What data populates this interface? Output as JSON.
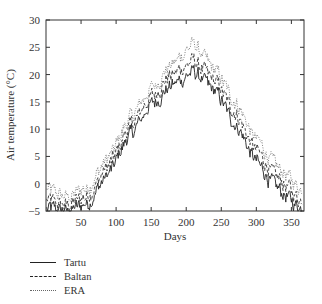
{
  "chart_data": {
    "type": "line",
    "title": "",
    "xlabel": "Days",
    "ylabel": "Air temperature (°C)",
    "xlim": [
      1,
      365
    ],
    "ylim": [
      -5,
      30
    ],
    "xticks": [
      50,
      100,
      150,
      200,
      250,
      300,
      350
    ],
    "yticks": [
      -5,
      0,
      5,
      10,
      15,
      20,
      25,
      30
    ],
    "grid": false,
    "legend_position": "below-left",
    "series": [
      {
        "name": "Tartu",
        "style": "solid",
        "x": [
          1,
          30,
          60,
          90,
          120,
          150,
          180,
          210,
          240,
          270,
          300,
          330,
          365
        ],
        "values": [
          -4.5,
          -5,
          -3.5,
          2,
          9,
          14.5,
          18,
          20.5,
          17,
          11,
          4,
          -1,
          -4.5
        ]
      },
      {
        "name": "Baltan",
        "style": "dashed",
        "x": [
          1,
          30,
          60,
          90,
          120,
          150,
          180,
          210,
          240,
          270,
          300,
          330,
          365
        ],
        "values": [
          -3,
          -4,
          -2,
          3.5,
          10.5,
          16,
          20,
          22.5,
          19,
          13,
          6,
          1,
          -3
        ]
      },
      {
        "name": "ERA",
        "style": "dotted",
        "x": [
          1,
          30,
          60,
          90,
          120,
          150,
          180,
          210,
          240,
          270,
          300,
          330,
          365
        ],
        "values": [
          -1,
          -2.5,
          -0.5,
          5,
          12,
          17.5,
          22,
          25.5,
          21,
          15,
          8,
          3,
          -1
        ]
      }
    ]
  },
  "legend": {
    "items": [
      {
        "label": "Tartu",
        "style": "solid"
      },
      {
        "label": "Baltan",
        "style": "dashed"
      },
      {
        "label": "ERA",
        "style": "dotted"
      }
    ]
  }
}
